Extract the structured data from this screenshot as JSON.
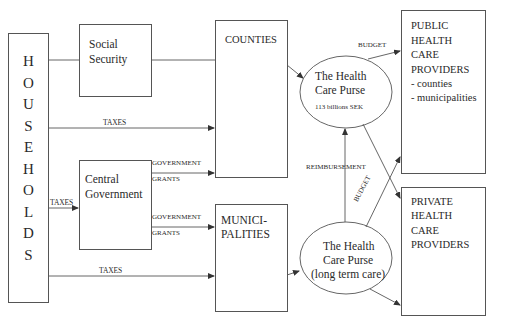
{
  "diagram": {
    "nodes": {
      "households": {
        "label": "HOUSEHOLDS",
        "letters": [
          "H",
          "O",
          "U",
          "S",
          "E",
          "H",
          "O",
          "L",
          "D",
          "S"
        ]
      },
      "social_security": {
        "line1": "Social",
        "line2": "Security"
      },
      "counties": {
        "label": "COUNTIES"
      },
      "central_government": {
        "line1": "Central",
        "line2": "Government"
      },
      "municipalities": {
        "line1": "MUNICI-",
        "line2": "PALITIES"
      },
      "health_care_purse": {
        "line1": "The Health",
        "line2": "Care Purse",
        "line3": "113 billions SEK"
      },
      "health_care_purse_ltc": {
        "line1": "The Health",
        "line2": "Care Purse",
        "line3": "(long term care)"
      },
      "public_providers": {
        "line1": "PUBLIC",
        "line2": "HEALTH",
        "line3": "CARE",
        "line4": "PROVIDERS",
        "line5": "- counties",
        "line6": "- municipalities"
      },
      "private_providers": {
        "line1": "PRIVATE",
        "line2": "HEALTH",
        "line3": "CARE",
        "line4": "PROVIDERS"
      }
    },
    "edge_labels": {
      "taxes_to_counties": "TAXES",
      "taxes_to_central": "TAXES",
      "taxes_to_municipalities": "TAXES",
      "grants_to_counties_1": "GOVERNMENT",
      "grants_to_counties_2": "GRANTS",
      "grants_to_municipalities_1": "GOVERNMENT",
      "grants_to_municipalities_2": "GRANTS",
      "budget_public": "BUDGET",
      "budget_ltc": "BUDGET",
      "reimbursement": "REIMBURSEMENT"
    },
    "colors": {
      "line": "#444444",
      "text": "#2a2a2a",
      "background": "#ffffff"
    }
  }
}
